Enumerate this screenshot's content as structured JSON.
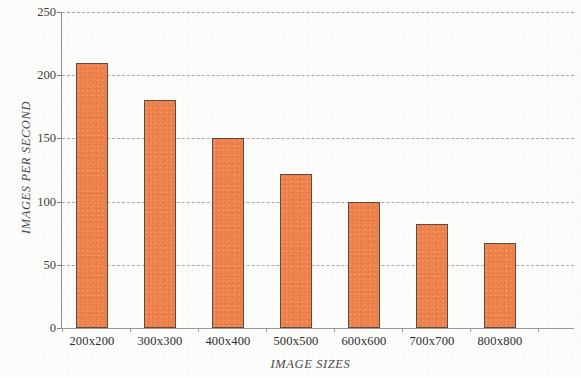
{
  "chart_data": {
    "type": "bar",
    "title": "",
    "subtitle": "",
    "xlabel": "IMAGE SIZES",
    "ylabel": "IMAGES PER SECOND",
    "categories": [
      "200x200",
      "300x300",
      "400x400",
      "500x500",
      "600x600",
      "700x700",
      "800x800"
    ],
    "values": [
      210,
      180,
      150,
      122,
      100,
      82,
      67
    ],
    "series": [
      {
        "name": "Images per second",
        "values": [
          210,
          180,
          150,
          122,
          100,
          82,
          67
        ]
      }
    ],
    "ylim": [
      0,
      250
    ],
    "yticks": [
      0,
      50,
      100,
      150,
      200,
      250
    ],
    "ytick_labels": [
      "0",
      "50",
      "100",
      "150",
      "200",
      "250"
    ],
    "xtick_labels": [
      "200x200",
      "300x300",
      "400x400",
      "500x500",
      "600x600",
      "700x700",
      "800x800"
    ],
    "grid": "horizontal-dashed",
    "legend": "none",
    "bar_color": "#EF8048",
    "bar_edge_color": "#5D4A42",
    "grid_color": "#A9AAB0",
    "axis_color": "#8E8E8E",
    "background_color": "#FDFDFC"
  }
}
